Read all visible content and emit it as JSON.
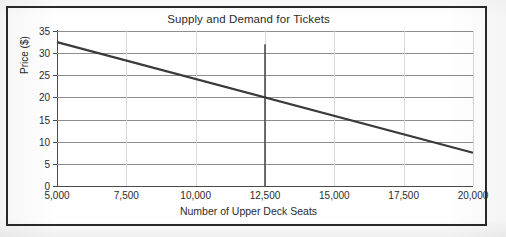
{
  "chart_data": {
    "type": "line",
    "title": "Supply and Demand for Tickets",
    "xlabel": "Number of Upper Deck Seats",
    "ylabel": "Price ($)",
    "xlim": [
      5000,
      20000
    ],
    "ylim": [
      0,
      35
    ],
    "grid": true,
    "legend": "none",
    "xticks": [
      5000,
      7500,
      10000,
      12500,
      15000,
      17500,
      20000
    ],
    "xtick_labels": [
      "5,000",
      "7,500",
      "10,000",
      "12,500",
      "15,000",
      "17,500",
      "20,000"
    ],
    "yticks": [
      0,
      5,
      10,
      15,
      20,
      25,
      30,
      35
    ],
    "ytick_labels": [
      "0",
      "5",
      "10",
      "15",
      "20",
      "25",
      "30",
      "35"
    ],
    "series": [
      {
        "name": "Demand",
        "type": "line",
        "color": "#3a3a3a",
        "width": 2.2,
        "x": [
          5000,
          20000
        ],
        "values": [
          32.5,
          7.5
        ]
      },
      {
        "name": "Supply",
        "type": "vertical-line",
        "color": "#4a4a4a",
        "width": 1.6,
        "x": [
          12500,
          12500
        ],
        "values": [
          0,
          32
        ]
      }
    ],
    "equilibrium": {
      "x": 12500,
      "y": 20
    }
  },
  "figure": {
    "title": "Supply and Demand for Tickets",
    "axis_color": "#4a4a4a",
    "grid_color": "#8c8c8c",
    "frame_color": "#2a2a2a",
    "background": "#ffffff"
  }
}
